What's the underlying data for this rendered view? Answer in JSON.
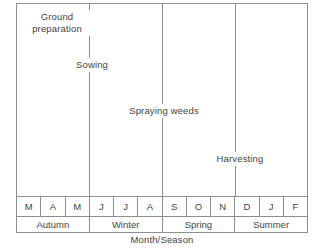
{
  "chart_data": {
    "type": "table",
    "title": "",
    "xlabel": "Month/Season",
    "ylabel": "Operation/Activity",
    "grid": false,
    "legend": "none",
    "categories": [
      "M",
      "A",
      "M",
      "J",
      "J",
      "A",
      "S",
      "O",
      "N",
      "D",
      "J",
      "F"
    ],
    "season_groups": [
      {
        "label": "Autumn",
        "months": [
          "M",
          "A",
          "M"
        ],
        "span": 3
      },
      {
        "label": "Winter",
        "months": [
          "J",
          "J",
          "A"
        ],
        "span": 3
      },
      {
        "label": "Spring",
        "months": [
          "S",
          "O",
          "N"
        ],
        "span": 3
      },
      {
        "label": "Summer",
        "months": [
          "D",
          "J",
          "F"
        ],
        "span": 3
      }
    ],
    "events": [
      {
        "name": "ground-preparation",
        "label": "Ground preparation",
        "label_line1": "Ground",
        "label_line2": "preparation",
        "month_index": 0,
        "month": "M",
        "season": "Autumn",
        "marker_x_pct": 0,
        "label_x_pct": 14,
        "label_y_pct": 6,
        "has_marker_line": false
      },
      {
        "name": "sowing",
        "label": "Sowing",
        "month_index": 3,
        "month": "J",
        "season": "Winter",
        "marker_x_pct": 25,
        "label_x_pct": 25,
        "label_y_pct": 30,
        "has_marker_line": true
      },
      {
        "name": "spraying-weeds",
        "label": "Spraying weeds",
        "month_index": 6,
        "month": "S",
        "season": "Spring",
        "marker_x_pct": 50,
        "label_x_pct": 50,
        "label_y_pct": 56,
        "has_marker_line": true
      },
      {
        "name": "harvesting",
        "label": "Harvesting",
        "month_index": 9,
        "month": "D",
        "season": "Summer",
        "marker_x_pct": 75,
        "label_x_pct": 75,
        "label_y_pct": 81,
        "has_marker_line": true
      }
    ],
    "colors": {
      "line": "#8e8e8e",
      "text": "#3f3f3f",
      "background": "#ffffff"
    }
  },
  "axes": {
    "y_label": "Operation/Activity",
    "x_label": "Month/Season"
  },
  "months": [
    "M",
    "A",
    "M",
    "J",
    "J",
    "A",
    "S",
    "O",
    "N",
    "D",
    "J",
    "F"
  ],
  "seasons": [
    "Autumn",
    "Winter",
    "Spring",
    "Summer"
  ],
  "events": {
    "ground_preparation_line1": "Ground",
    "ground_preparation_line2": "preparation",
    "sowing": "Sowing",
    "spraying_weeds": "Spraying weeds",
    "harvesting": "Harvesting"
  }
}
